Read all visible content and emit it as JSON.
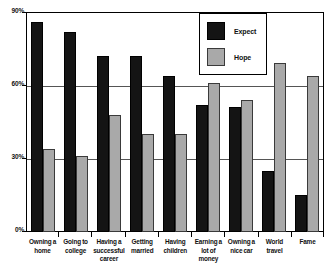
{
  "chart_data": {
    "type": "bar",
    "title": "",
    "xlabel": "",
    "ylabel": "",
    "ylim": [
      0,
      90
    ],
    "yticks": [
      0,
      30,
      60,
      90
    ],
    "ytick_labels": [
      "0%",
      "30%",
      "60%",
      "90%"
    ],
    "grid": true,
    "legend_position": "top-right",
    "categories": [
      "Owning a home",
      "Going to college",
      "Having a successful career",
      "Getting married",
      "Having children",
      "Earning a lot of money",
      "Owning a nice car",
      "World travel",
      "Fame"
    ],
    "series": [
      {
        "name": "Expect",
        "color": "#141414",
        "values": [
          86,
          82,
          72,
          72,
          64,
          52,
          51,
          25,
          15
        ]
      },
      {
        "name": "Hope",
        "color": "#a9a9a9",
        "values": [
          34,
          31,
          48,
          40,
          40,
          61,
          54,
          69,
          64
        ]
      }
    ]
  },
  "legend": {
    "items": [
      {
        "label": "Expect"
      },
      {
        "label": "Hope"
      }
    ]
  }
}
